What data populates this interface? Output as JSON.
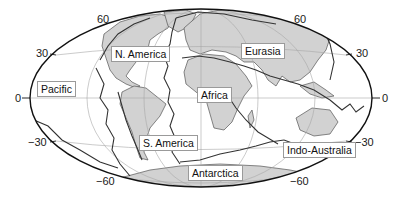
{
  "map": {
    "title": "Major tectonic plates",
    "projection": "Hammer (equal-area elliptical)",
    "colors": {
      "land": "#d2d2d2",
      "coast": "#555555",
      "plate_boundary": "#333333",
      "graticule": "#a8a8a8",
      "outline": "#111111",
      "label_border": "#9a9a9a"
    },
    "latitude_ticks": {
      "left": [
        "60",
        "30",
        "0",
        "−30",
        "−60"
      ],
      "right": [
        "60",
        "30",
        "0",
        "−30",
        "−60"
      ]
    },
    "plates": [
      {
        "name": "N. America"
      },
      {
        "name": "Eurasia"
      },
      {
        "name": "Pacific"
      },
      {
        "name": "Africa"
      },
      {
        "name": "S. America"
      },
      {
        "name": "Indo-Australia"
      },
      {
        "name": "Antarctica"
      }
    ]
  }
}
